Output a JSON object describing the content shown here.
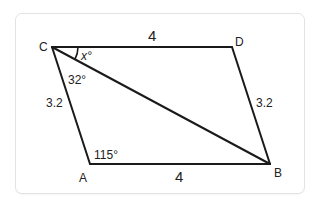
{
  "figure": {
    "type": "parallelogram-with-diagonal",
    "vertices": [
      {
        "name": "C",
        "label": "C"
      },
      {
        "name": "D",
        "label": "D"
      },
      {
        "name": "B",
        "label": "B"
      },
      {
        "name": "A",
        "label": "A"
      }
    ],
    "sides": {
      "CD": "4",
      "AB": "4",
      "CA": "3.2",
      "DB": "3.2"
    },
    "angles": {
      "DCB": "x°",
      "BCA": "32°",
      "CAB": "115°"
    },
    "colors": {
      "stroke": "#1a1a1a",
      "text": "#222222",
      "card_border": "#e3e3e3",
      "background": "#ffffff"
    }
  }
}
